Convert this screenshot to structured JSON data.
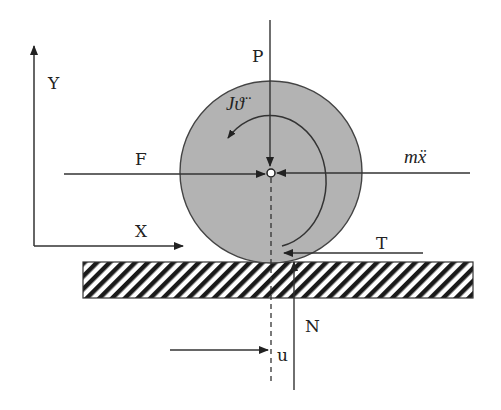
{
  "diagram": {
    "type": "free-body-diagram",
    "colors": {
      "disk_fill": "#b3b3b3",
      "stroke": "#333333",
      "background": "#ffffff"
    },
    "axes": {
      "y_label": "Y",
      "x_label": "X"
    },
    "forces": {
      "P": "P",
      "F": "F",
      "inertia": "mẍ",
      "moment": "Jϑ̈",
      "T": "T",
      "N": "N",
      "u": "u"
    }
  }
}
